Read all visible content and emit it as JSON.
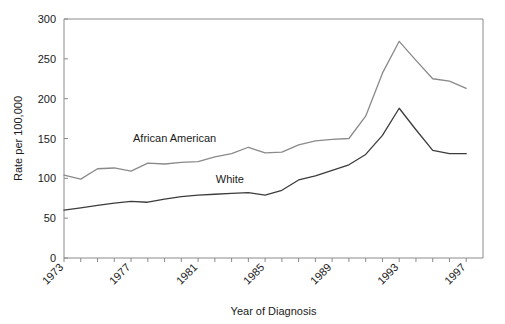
{
  "chart_data": {
    "type": "line",
    "title": "",
    "xlabel": "Year of Diagnosis",
    "ylabel": "Rate per 100,000",
    "xlim": [
      1973,
      1998
    ],
    "ylim": [
      0,
      300
    ],
    "yticks": [
      0,
      50,
      100,
      150,
      200,
      250,
      300
    ],
    "xticks": [
      1973,
      1977,
      1981,
      1985,
      1989,
      1993,
      1997
    ],
    "xtick_labels": [
      "1973",
      "1977",
      "1981",
      "1985",
      "1989",
      "1993",
      "1997"
    ],
    "ytick_labels": [
      "0",
      "50",
      "100",
      "150",
      "200",
      "250",
      "300"
    ],
    "grid": false,
    "legend_position": "inline-annotation",
    "x": [
      1973,
      1974,
      1975,
      1976,
      1977,
      1978,
      1979,
      1980,
      1981,
      1982,
      1983,
      1984,
      1985,
      1986,
      1987,
      1988,
      1989,
      1990,
      1991,
      1992,
      1993,
      1994,
      1995,
      1996,
      1997
    ],
    "series": [
      {
        "name": "African American",
        "color": "#8a8a8a",
        "values": [
          104,
          99,
          112,
          113,
          109,
          119,
          118,
          120,
          121,
          127,
          131,
          139,
          132,
          133,
          142,
          147,
          149,
          150,
          178,
          232,
          272,
          248,
          225,
          222,
          213
        ]
      },
      {
        "name": "White",
        "color": "#3c3c3c",
        "values": [
          60,
          63,
          66,
          69,
          71,
          70,
          74,
          77,
          79,
          80,
          81,
          82,
          79,
          85,
          98,
          103,
          110,
          117,
          130,
          154,
          188,
          161,
          135,
          131,
          131
        ]
      }
    ],
    "annotations": [
      {
        "text": "African American",
        "x": 1979.6,
        "y": 146
      },
      {
        "text": "White",
        "x": 1982.9,
        "y": 94
      }
    ]
  },
  "axes": {
    "y_axis_title": "Rate per 100,000",
    "x_axis_title": "Year of Diagnosis"
  }
}
